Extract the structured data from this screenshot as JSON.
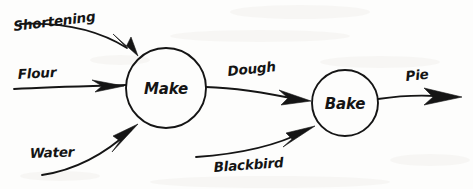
{
  "diagram": {
    "kind": "data-flow-diagram",
    "style": "hand-drawn sketch on paper",
    "ink_color": "#151515",
    "paper_color": "#fdfdfc",
    "nodes": [
      {
        "id": "make",
        "label": "Make",
        "shape": "circle",
        "cx": 166,
        "cy": 88,
        "r": 40
      },
      {
        "id": "bake",
        "label": "Bake",
        "shape": "circle",
        "cx": 345,
        "cy": 103,
        "r": 33
      }
    ],
    "flows": [
      {
        "id": "shortening",
        "label": "Shortening",
        "from": "external",
        "to": "make",
        "direction": "in",
        "label_x": 14,
        "label_y": 31
      },
      {
        "id": "flour",
        "label": "Flour",
        "from": "external",
        "to": "make",
        "direction": "in",
        "label_x": 18,
        "label_y": 79
      },
      {
        "id": "water",
        "label": "Water",
        "from": "external",
        "to": "make",
        "direction": "in",
        "label_x": 30,
        "label_y": 158
      },
      {
        "id": "dough",
        "label": "Dough",
        "from": "make",
        "to": "bake",
        "direction": "between",
        "label_x": 228,
        "label_y": 76
      },
      {
        "id": "blackbird",
        "label": "Blackbird",
        "from": "external",
        "to": "bake",
        "direction": "in",
        "label_x": 214,
        "label_y": 172
      },
      {
        "id": "pie",
        "label": "Pie",
        "from": "bake",
        "to": "external",
        "direction": "out",
        "label_x": 406,
        "label_y": 81
      }
    ]
  }
}
